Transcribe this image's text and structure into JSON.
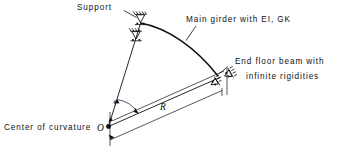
{
  "figure": {
    "type": "engineering-diagram",
    "background_color": "#ffffff",
    "line_color": "#101010"
  },
  "labels": {
    "support": "Support",
    "main_girder": "Main girder with EI, GK",
    "end_floor_beam_line1": "End floor beam with",
    "end_floor_beam_line2": "infinite rigidities",
    "center_of_curvature": "Center of curvature"
  },
  "symbols": {
    "origin_point": "O",
    "radius": "R",
    "subtended_angle": "φ"
  },
  "annotations": {
    "supports_count": 2,
    "end_supports_count": 2,
    "dimension_label": "R"
  },
  "geometry": {
    "center": {
      "x": 108,
      "y": 127
    },
    "crown": {
      "x": 140,
      "y": 22
    },
    "end": {
      "x": 222,
      "y": 77
    },
    "radius_px": 106
  }
}
